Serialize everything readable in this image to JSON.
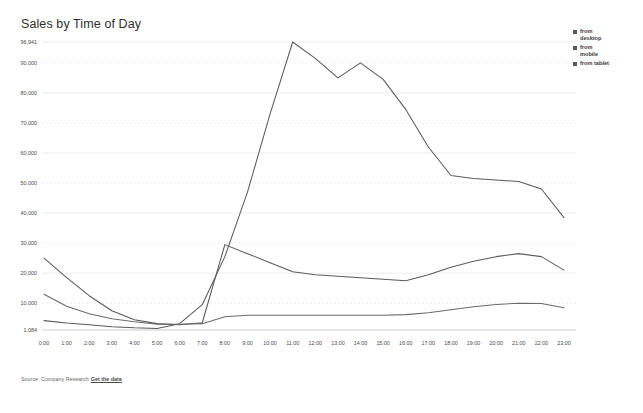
{
  "header": {
    "title": "Sales by Time of Day"
  },
  "footer": {
    "source_label": "Source: Company Research",
    "link_label": "Get the data"
  },
  "legend": {
    "position": "right",
    "items": [
      {
        "label": "from desktop",
        "color": "#595959"
      },
      {
        "label": "from mobile",
        "color": "#595959"
      },
      {
        "label": "from tablet",
        "color": "#595959"
      }
    ]
  },
  "colors": {
    "background": "#ffffff",
    "grid": "#e8e8e8",
    "axis": "#cfcfcf",
    "text": "#4a4a4a",
    "line_desktop": "#5a5a5a",
    "line_mobile": "#5a5a5a",
    "line_tablet": "#6a6a6a"
  },
  "chart_data": {
    "type": "line",
    "title": "Sales by Time of Day",
    "xlabel": "",
    "ylabel": "",
    "grid": true,
    "legend_position": "right",
    "ylim": [
      1084,
      96941
    ],
    "ytick_labels": [
      "96,941",
      "90,000",
      "80,000",
      "70,000",
      "60,000",
      "50,000",
      "40,000",
      "30,000",
      "20,000",
      "10,000",
      "1,084"
    ],
    "ytick_values": [
      96941,
      90000,
      80000,
      70000,
      60000,
      50000,
      40000,
      30000,
      20000,
      10000,
      1084
    ],
    "categories": [
      "0:00",
      "1:00",
      "2:00",
      "3:00",
      "4:00",
      "5:00",
      "6:00",
      "7:00",
      "8:00",
      "9:00",
      "10:00",
      "11:00",
      "12:00",
      "13:00",
      "14:00",
      "15:00",
      "16:00",
      "17:00",
      "18:00",
      "19:00",
      "20:00",
      "21:00",
      "22:00",
      "23:00"
    ],
    "series": [
      {
        "name": "from desktop",
        "color": "#5a5a5a",
        "values": [
          4200,
          3400,
          2800,
          2200,
          1800,
          1600,
          3200,
          9500,
          25500,
          47000,
          73000,
          96941,
          91500,
          85000,
          90000,
          84500,
          74500,
          62000,
          52500,
          51500,
          51000,
          50500,
          48000,
          38500
        ]
      },
      {
        "name": "from mobile",
        "color": "#5a5a5a",
        "values": [
          25000,
          18500,
          12500,
          7500,
          4500,
          3200,
          2800,
          3500,
          29500,
          26500,
          23500,
          20500,
          19500,
          19000,
          18500,
          18000,
          17500,
          19500,
          22000,
          24000,
          25500,
          26500,
          25500,
          21000
        ]
      },
      {
        "name": "from tablet",
        "color": "#6a6a6a",
        "values": [
          13000,
          9000,
          6500,
          4800,
          3800,
          3000,
          3000,
          3200,
          5500,
          6000,
          6000,
          6000,
          6000,
          6000,
          6000,
          6000,
          6200,
          6800,
          7800,
          8800,
          9600,
          10000,
          9900,
          8500
        ]
      }
    ]
  }
}
